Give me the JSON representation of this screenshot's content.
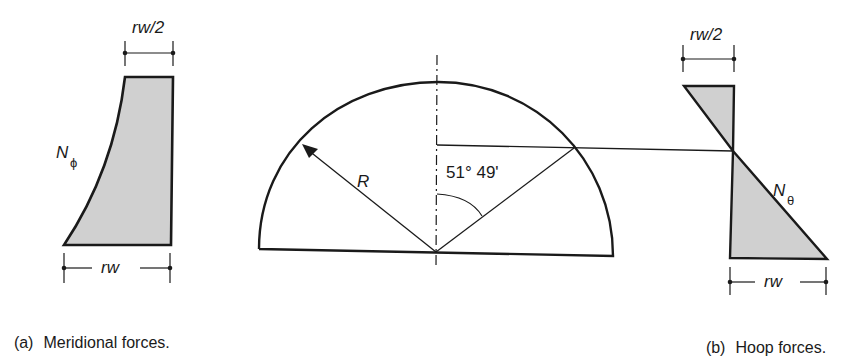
{
  "figure": {
    "panel_a": {
      "caption_tag": "(a)",
      "caption_text": "Meridional forces.",
      "force_symbol": "N",
      "force_subscript": "ϕ",
      "top_dimension": "rw/2",
      "bottom_dimension": "rw"
    },
    "dome": {
      "radius_label": "R",
      "angle_label": "51° 49'"
    },
    "panel_b": {
      "caption_tag": "(b)",
      "caption_text": "Hoop forces.",
      "force_symbol": "N",
      "force_subscript": "θ",
      "top_dimension": "rw/2",
      "bottom_dimension": "rw"
    },
    "colors": {
      "line": "#1a1a1a",
      "fill": "#d0d0d0"
    }
  }
}
